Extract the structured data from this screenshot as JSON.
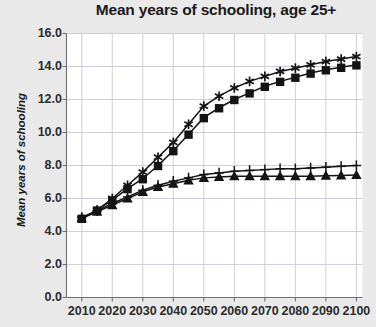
{
  "chart_data": {
    "type": "line",
    "title": "Mean years of schooling, age 25+",
    "xlabel": "",
    "ylabel": "Mean years of schooling",
    "xlim": [
      2005,
      2102
    ],
    "ylim": [
      0.0,
      16.0
    ],
    "grid": true,
    "legend_position": "none",
    "xtick_labels": [
      "2010",
      "2020",
      "2030",
      "2040",
      "2050",
      "2060",
      "2070",
      "2080",
      "2090",
      "2100"
    ],
    "ytick_labels": [
      "0.0",
      "2.0",
      "4.0",
      "6.0",
      "8.0",
      "10.0",
      "12.0",
      "14.0",
      "16.0"
    ],
    "x": [
      2010,
      2015,
      2020,
      2025,
      2030,
      2035,
      2040,
      2045,
      2050,
      2055,
      2060,
      2065,
      2070,
      2075,
      2080,
      2085,
      2090,
      2095,
      2100
    ],
    "series": [
      {
        "name": "Fast development (star)",
        "marker": "star",
        "values": [
          4.8,
          5.3,
          6.0,
          6.8,
          7.6,
          8.5,
          9.4,
          10.5,
          11.6,
          12.2,
          12.7,
          13.1,
          13.4,
          13.7,
          13.9,
          14.1,
          14.3,
          14.45,
          14.6
        ]
      },
      {
        "name": "Medium development (square)",
        "marker": "square",
        "values": [
          4.8,
          5.3,
          5.9,
          6.6,
          7.2,
          8.0,
          8.9,
          9.9,
          10.9,
          11.5,
          12.0,
          12.4,
          12.8,
          13.1,
          13.35,
          13.6,
          13.8,
          13.95,
          14.1
        ]
      },
      {
        "name": "Constant enrollment (plus)",
        "marker": "plus",
        "values": [
          4.85,
          5.25,
          5.7,
          6.1,
          6.5,
          6.8,
          7.05,
          7.25,
          7.45,
          7.55,
          7.65,
          7.7,
          7.75,
          7.8,
          7.8,
          7.85,
          7.9,
          7.95,
          8.0
        ]
      },
      {
        "name": "No development (triangle)",
        "marker": "triangle",
        "values": [
          4.8,
          5.2,
          5.6,
          6.0,
          6.4,
          6.7,
          6.9,
          7.1,
          7.25,
          7.3,
          7.35,
          7.35,
          7.35,
          7.35,
          7.35,
          7.35,
          7.38,
          7.4,
          7.42
        ]
      }
    ]
  },
  "colors": {
    "background": "#e9e9e9",
    "plot_background": "#ffffff",
    "grid": "#c9c9d2",
    "axis": "#6e6e78",
    "series": "#141414",
    "title": "#1a1a1a",
    "tick_label": "#2b2b2b"
  }
}
